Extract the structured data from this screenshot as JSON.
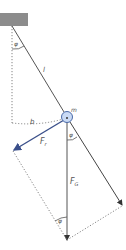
{
  "diagram": {
    "colors": {
      "ceiling": "#8c8c8c",
      "line": "#555555",
      "restoring_force": "#3a4f8a",
      "mass_fill": "#c9daf5",
      "mass_stroke": "#4a6aa8",
      "dotted": "#777777"
    },
    "labels": {
      "angle_top": "φ",
      "length": "l",
      "mass": "m",
      "arc": "b",
      "restoring_force": "F",
      "restoring_force_sub": "r",
      "gravity_force": "F",
      "gravity_force_sub": "G",
      "angle_mid": "φ",
      "angle_bottom": "φ"
    }
  }
}
